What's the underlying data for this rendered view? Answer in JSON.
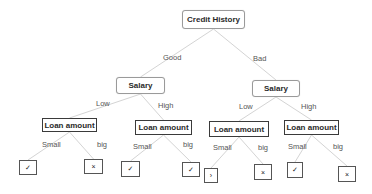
{
  "diagram": {
    "type": "decision-tree",
    "root": {
      "label": "Credit History",
      "box": {
        "x": 182,
        "y": 10,
        "w": 63,
        "h": 19
      }
    },
    "level1": [
      {
        "label": "Salary",
        "edge_label": "Good",
        "box": {
          "x": 116,
          "y": 77,
          "w": 49,
          "h": 17
        },
        "edge_label_pos": {
          "x": 163,
          "y": 54
        }
      },
      {
        "label": "Salary",
        "edge_label": "Bad",
        "box": {
          "x": 252,
          "y": 80,
          "w": 48,
          "h": 17
        },
        "edge_label_pos": {
          "x": 253,
          "y": 55
        }
      }
    ],
    "level2": [
      {
        "label": "Loan amount",
        "edge_label": "Low",
        "parent": 0,
        "box": {
          "x": 42,
          "y": 118,
          "w": 55,
          "h": 14
        },
        "edge_label_pos": {
          "x": 96,
          "y": 100
        }
      },
      {
        "label": "Loan amount",
        "edge_label": "High",
        "parent": 0,
        "box": {
          "x": 135,
          "y": 120,
          "w": 57,
          "h": 15
        },
        "edge_label_pos": {
          "x": 158,
          "y": 102
        }
      },
      {
        "label": "Loan amount",
        "edge_label": "Low",
        "parent": 1,
        "box": {
          "x": 209,
          "y": 121,
          "w": 60,
          "h": 16
        },
        "edge_label_pos": {
          "x": 239,
          "y": 103
        }
      },
      {
        "label": "Loan amount",
        "edge_label": "High",
        "parent": 1,
        "box": {
          "x": 284,
          "y": 120,
          "w": 55,
          "h": 15
        },
        "edge_label_pos": {
          "x": 301,
          "y": 103
        }
      }
    ],
    "leaves": [
      {
        "symbol": "✓",
        "outcome": "yes",
        "edge_label": "Small",
        "parent": 0,
        "box": {
          "x": 19,
          "y": 160,
          "w": 18,
          "h": 15
        },
        "edge_label_pos": {
          "x": 42,
          "y": 141
        }
      },
      {
        "symbol": "×",
        "outcome": "no",
        "edge_label": "big",
        "parent": 0,
        "box": {
          "x": 84,
          "y": 159,
          "w": 19,
          "h": 15
        },
        "edge_label_pos": {
          "x": 97,
          "y": 141
        }
      },
      {
        "symbol": "✓",
        "outcome": "yes",
        "edge_label": "Small",
        "parent": 1,
        "box": {
          "x": 121,
          "y": 161,
          "w": 19,
          "h": 16
        },
        "edge_label_pos": {
          "x": 133,
          "y": 143
        }
      },
      {
        "symbol": "✓",
        "outcome": "yes",
        "edge_label": "big",
        "parent": 1,
        "box": {
          "x": 182,
          "y": 162,
          "w": 18,
          "h": 15
        },
        "edge_label_pos": {
          "x": 183,
          "y": 141
        }
      },
      {
        "symbol": "›",
        "outcome": "yes",
        "edge_label": "Small",
        "parent": 2,
        "box": {
          "x": 204,
          "y": 168,
          "w": 14,
          "h": 15
        },
        "edge_label_pos": {
          "x": 213,
          "y": 144
        }
      },
      {
        "symbol": "×",
        "outcome": "no",
        "edge_label": "big",
        "parent": 2,
        "box": {
          "x": 254,
          "y": 164,
          "w": 18,
          "h": 16
        },
        "edge_label_pos": {
          "x": 258,
          "y": 144
        }
      },
      {
        "symbol": "✓",
        "outcome": "yes",
        "edge_label": "Small",
        "parent": 3,
        "box": {
          "x": 287,
          "y": 162,
          "w": 16,
          "h": 16
        },
        "edge_label_pos": {
          "x": 288,
          "y": 143
        }
      },
      {
        "symbol": "×",
        "outcome": "no",
        "edge_label": "big",
        "parent": 3,
        "box": {
          "x": 338,
          "y": 166,
          "w": 18,
          "h": 16
        },
        "edge_label_pos": {
          "x": 333,
          "y": 143
        }
      }
    ],
    "colors": {
      "edge": "#d4d4d4",
      "node_border_root": "#9a9a9a",
      "node_border_rect": "#3a3a3a",
      "text": "#2a2a2a",
      "edge_label": "#555555"
    }
  }
}
